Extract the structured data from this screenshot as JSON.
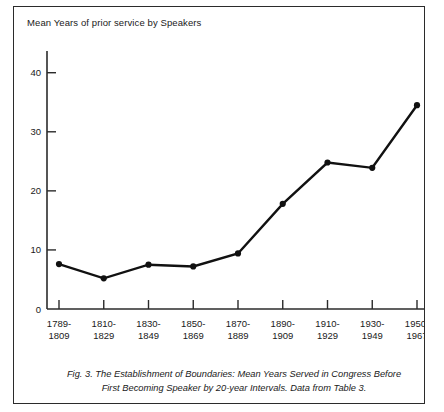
{
  "figure": {
    "axis_title": "Mean Years of prior\nservice by Speakers",
    "caption_line1": "Fig. 3. The Establishment of Boundaries: Mean Years Served in Congress Before",
    "caption_line2": "First Becoming Speaker by 20-year Intervals. Data from Table 3.",
    "border_color": "#2b2b2b",
    "line_color": "#111111",
    "background": "#ffffff"
  },
  "chart_data": {
    "type": "line",
    "title": "Mean Years of prior service by Speakers",
    "xlabel": "",
    "ylabel": "Mean Years of prior service by Speakers",
    "categories": [
      "1789-\n1809",
      "1810-\n1829",
      "1830-\n1849",
      "1850-\n1869",
      "1870-\n1889",
      "1890-\n1909",
      "1910-\n1929",
      "1930-\n1949",
      "1950-\n1967"
    ],
    "category_labels_top": [
      "1789-",
      "1810-",
      "1830-",
      "1850-",
      "1870-",
      "1890-",
      "1910-",
      "1930-",
      "1950-"
    ],
    "category_labels_bottom": [
      "1809",
      "1829",
      "1849",
      "1869",
      "1889",
      "1909",
      "1929",
      "1949",
      "1967"
    ],
    "values": [
      7.6,
      5.2,
      7.5,
      7.2,
      9.4,
      17.8,
      24.8,
      23.9,
      34.5
    ],
    "ylim": [
      0,
      43
    ],
    "yticks": [
      0,
      10,
      20,
      30,
      40
    ],
    "ytick_labels": [
      "0",
      "10",
      "20",
      "30",
      "40"
    ],
    "grid": false,
    "legend": "none",
    "markers": true,
    "annotation": "Fig. 3. The Establishment of Boundaries: Mean Years Served in Congress Before First Becoming Speaker by 20-year Intervals. Data from Table 3."
  }
}
